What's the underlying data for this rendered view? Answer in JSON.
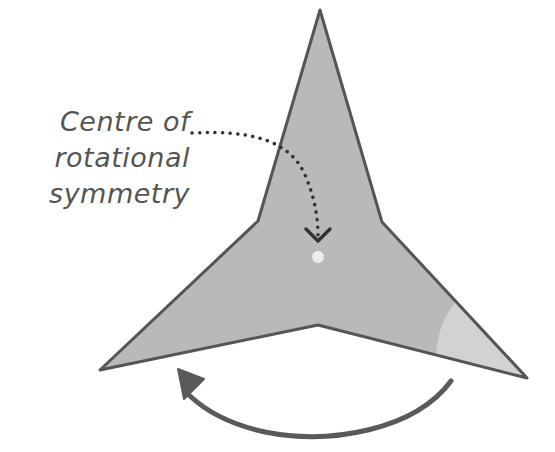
{
  "diagram": {
    "label": {
      "line1": "Centre of",
      "line2": "rotational",
      "line3": "symmetry"
    },
    "colors": {
      "shape_fill": "#b9b9b9",
      "shape_stroke": "#555555",
      "highlight_wedge": "#d2d2d2",
      "centre_dot": "#e8e8e8",
      "pointer": "#333333",
      "arrow": "#555555",
      "text": "#555555"
    },
    "shape": {
      "type": "three-pointed star",
      "vertices": [
        [
          320,
          10
        ],
        [
          382,
          222
        ],
        [
          527,
          378
        ],
        [
          318,
          325
        ],
        [
          100,
          370
        ],
        [
          258,
          221
        ]
      ]
    },
    "centre": [
      318,
      256
    ],
    "rotation_direction": "anticlockwise"
  }
}
